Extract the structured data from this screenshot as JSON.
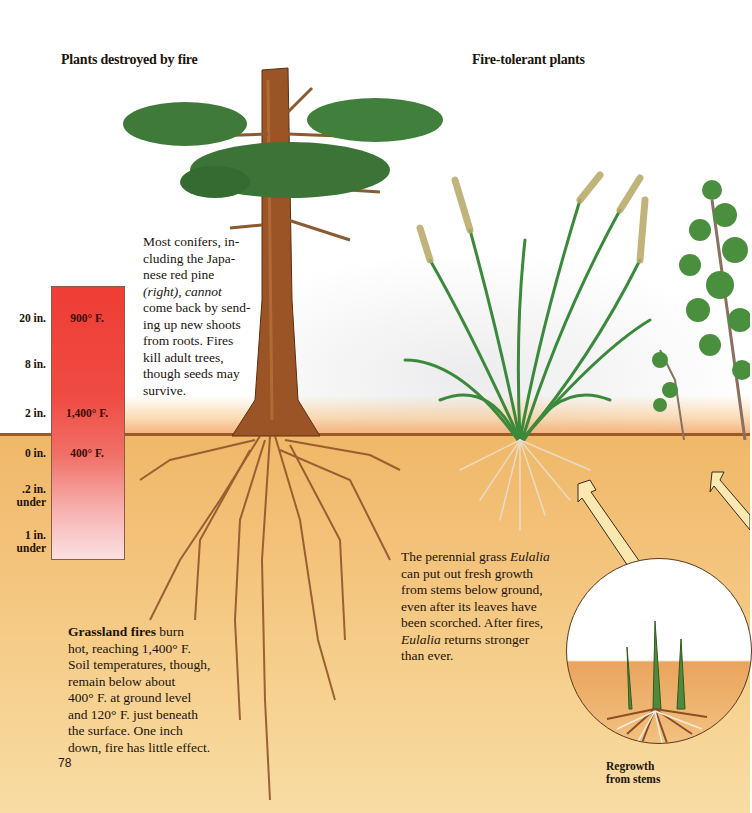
{
  "page": {
    "number": "78",
    "headings": {
      "left": "Plants destroyed by fire",
      "right": "Fire-tolerant plants"
    },
    "captions": {
      "conifers": "Most conifers, including the Japanese red pine (right), cannot come back by sending up new shoots from roots. Fires kill adult trees, though seeds may survive.",
      "conifers_lines": [
        "Most conifers, in-",
        "cluding the Japa-",
        "nese red pine",
        "(right), cannot",
        "come back by send-",
        "ing up new shoots",
        "from roots. Fires",
        "kill adult trees,",
        "though seeds may",
        "survive."
      ],
      "grassland_bold": "Grassland fires",
      "grassland_lines": [
        " burn",
        "hot, reaching 1,400° F.",
        "Soil temperatures, though,",
        "remain below about",
        "400° F. at ground level",
        "and 120° F. just beneath",
        "the surface. One inch",
        "down, fire has little effect."
      ],
      "eulalia_lines": [
        "The perennial grass ",
        "Eulalia",
        "can put out fresh growth",
        "from stems below ground,",
        "even after its leaves have",
        "been scorched. After fires,",
        "Eulalia",
        " returns stronger",
        "than ever."
      ],
      "regrowth_label_lines": [
        "Regrowth",
        "from stems"
      ]
    }
  },
  "temperature_scale": {
    "heights": [
      {
        "label": "20 in.",
        "temp": "900° F."
      },
      {
        "label": "8 in.",
        "temp": ""
      },
      {
        "label": "2 in.",
        "temp": "1,400° F."
      },
      {
        "label": "0 in.",
        "temp": "400° F."
      },
      {
        "label": ".2 in.",
        "sub": "under",
        "temp": ""
      },
      {
        "label": "1 in.",
        "sub": "under",
        "temp": ""
      }
    ],
    "colors": {
      "top": "#ee3d35",
      "bottom": "#fbe0e2"
    }
  },
  "illustrations": {
    "left": "japanese-red-pine",
    "center": "eulalia-grass",
    "right": "shrub",
    "inset": "regrowth-circle"
  },
  "colors": {
    "soil": "#f3c27a",
    "ground_line": "#9a5a2a",
    "foliage": "#3f7a3a",
    "trunk": "#8a4a24",
    "flame": "#f0965a"
  }
}
